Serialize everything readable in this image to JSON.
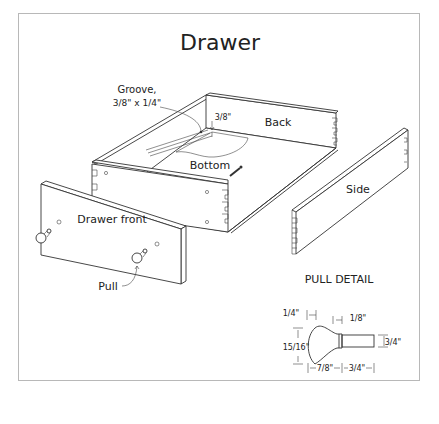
{
  "title": "Drawer",
  "labels": {
    "groove_line1": "Groove,",
    "groove_line2": "3/8\" x 1/4\"",
    "groove_depth": "3/8\"",
    "back": "Back",
    "bottom": "Bottom",
    "side": "Side",
    "drawer_front": "Drawer front",
    "pull": "Pull"
  },
  "pull_detail": {
    "heading": "PULL DETAIL",
    "dimensions": {
      "knob_edge": "1/4\"",
      "collar": "1/8\"",
      "knob_diameter": "15/16\"",
      "tenon_diameter": "3/4\"",
      "knob_length": "7/8\"",
      "tenon_length": "3/4\""
    }
  },
  "colors": {
    "line": "#333333",
    "frame_border": "#b8b8b8",
    "text": "#222222"
  }
}
